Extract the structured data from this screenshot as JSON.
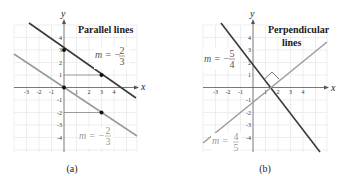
{
  "panels": [
    {
      "caption": "(a)",
      "title": "Parallel lines",
      "x_axis_label": "x",
      "y_axis_label": "y",
      "x_ticks": [
        "-3",
        "-2",
        "-1",
        "1",
        "2",
        "3",
        "4"
      ],
      "y_ticks": [
        "4",
        "3",
        "2",
        "1",
        "-1",
        "-2",
        "-3",
        "-4"
      ],
      "lines": [
        {
          "name": "upper-line",
          "slope": "-2/3",
          "intercept": 3,
          "color": "#3a3a3a"
        },
        {
          "name": "lower-line",
          "slope": "-2/3",
          "intercept": 0,
          "color": "#9a9a9a"
        }
      ],
      "slope_labels": [
        {
          "m": "m = −",
          "num": "2",
          "den": "3"
        },
        {
          "m": "m = −",
          "num": "2",
          "den": "3"
        }
      ],
      "points": [
        [
          0,
          3
        ],
        [
          3,
          1
        ],
        [
          0,
          0
        ],
        [
          3,
          -2
        ]
      ]
    },
    {
      "caption": "(b)",
      "title_line1": "Perpendicular",
      "title_line2": "lines",
      "x_axis_label": "x",
      "y_axis_label": "y",
      "x_ticks": [
        "-3",
        "-2",
        "-1",
        "1",
        "2",
        "3",
        "4"
      ],
      "y_ticks": [
        "4",
        "3",
        "2",
        "1",
        "-1",
        "-2",
        "-3",
        "-4"
      ],
      "lines": [
        {
          "name": "steep-line",
          "slope": "-5/4",
          "color": "#3a3a3a"
        },
        {
          "name": "rising-line",
          "slope": "4/5",
          "color": "#9a9a9a"
        }
      ],
      "slope_labels": [
        {
          "m": "m = −",
          "num": "5",
          "den": "4"
        },
        {
          "m": "m = ",
          "num": "4",
          "den": "5"
        }
      ]
    }
  ]
}
